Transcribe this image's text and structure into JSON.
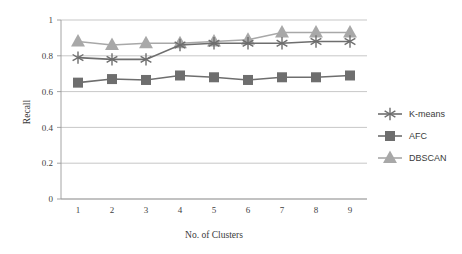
{
  "chart_data": {
    "type": "line",
    "title": "",
    "xlabel": "No. of Clusters",
    "ylabel": "Recall",
    "x": [
      1,
      2,
      3,
      4,
      5,
      6,
      7,
      8,
      9
    ],
    "categories": [
      "1",
      "2",
      "3",
      "4",
      "5",
      "6",
      "7",
      "8",
      "9"
    ],
    "xlim": [
      0.5,
      9.5
    ],
    "ylim": [
      0,
      1
    ],
    "yticks": [
      0,
      0.2,
      0.4,
      0.6,
      0.8,
      1
    ],
    "ytick_labels": [
      "0",
      "0.2",
      "0.4",
      "0.6",
      "0.8",
      "1"
    ],
    "xtick_labels": [
      "1",
      "2",
      "3",
      "4",
      "5",
      "6",
      "7",
      "8",
      "9"
    ],
    "grid": "horizontal",
    "legend_position": "right",
    "series": [
      {
        "name": "K-means",
        "marker": "asterisk",
        "color": "#6e6e6e",
        "values": [
          0.79,
          0.78,
          0.78,
          0.86,
          0.87,
          0.87,
          0.87,
          0.88,
          0.88
        ]
      },
      {
        "name": "AFC",
        "marker": "square",
        "color": "#6e6e6e",
        "values": [
          0.65,
          0.67,
          0.665,
          0.69,
          0.68,
          0.665,
          0.68,
          0.68,
          0.69
        ]
      },
      {
        "name": "DBSCAN",
        "marker": "triangle",
        "color": "#a8a8a8",
        "values": [
          0.88,
          0.86,
          0.87,
          0.87,
          0.88,
          0.89,
          0.93,
          0.93,
          0.93
        ]
      }
    ]
  },
  "legend": {
    "entries": [
      {
        "label": "K-means"
      },
      {
        "label": "AFC"
      },
      {
        "label": "DBSCAN"
      }
    ]
  },
  "axes": {
    "y_title": "Recall",
    "x_title": "No. of Clusters"
  }
}
